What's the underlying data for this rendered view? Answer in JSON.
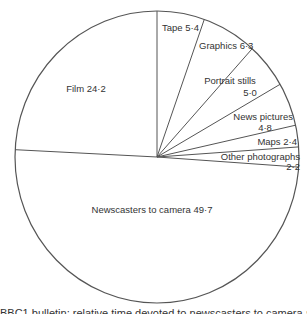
{
  "chart_data": {
    "type": "pie",
    "title": "",
    "start": "12 o'clock, clockwise",
    "slices": [
      {
        "label": "Tape",
        "value": 5.4
      },
      {
        "label": "Graphics",
        "value": 6.3
      },
      {
        "label": "Portrait stills",
        "value": 5.0
      },
      {
        "label": "News pictures",
        "value": 4.8
      },
      {
        "label": "Maps",
        "value": 2.4
      },
      {
        "label": "Other photographs",
        "value": 2.2
      },
      {
        "label": "Newscasters to camera",
        "value": 49.7
      },
      {
        "label": "Film",
        "value": 24.2
      }
    ],
    "labels_text": {
      "tape": "Tape 5·4",
      "graphics": "Graphics 6·3",
      "portrait_line1": "Portrait stills",
      "portrait_line2": "5·0",
      "news_line1": "News pictures",
      "news_line2": "4·8",
      "maps": "Maps 2·4",
      "other_line1": "Other photographs",
      "other_line2": "2·2",
      "newscasters": "Newscasters to camera 49·7",
      "film": "Film 24·2"
    },
    "colors": {
      "stroke": "#555555",
      "background": "#ffffff",
      "text": "#333333"
    }
  },
  "caption": "BBC1 bulletin: relative time devoted to newscasters to camera and visual elements"
}
